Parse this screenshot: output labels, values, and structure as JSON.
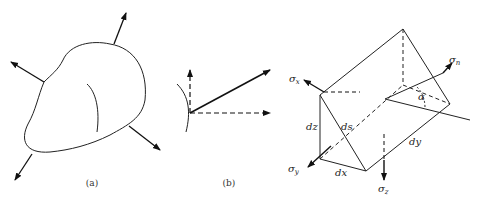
{
  "figure": {
    "panels": [
      {
        "id": "a",
        "caption": "(a)",
        "description": "Arbitrary body with outward force arrows on its surface"
      },
      {
        "id": "b",
        "caption": "(b)",
        "description": "Resultant stress vector at a surface point decomposed into normal and tangential dashed components"
      },
      {
        "id": "c",
        "caption": "",
        "description": "Triangular prism element with stresses on its faces"
      }
    ],
    "labels": {
      "sigma_x": {
        "base": "σ",
        "sub": "x"
      },
      "sigma_n": {
        "base": "σ",
        "sub": "n"
      },
      "sigma_y": {
        "base": "σ",
        "sub": "y"
      },
      "sigma_z": {
        "base": "σ",
        "sub": "z"
      },
      "dz": "dz",
      "ds": "ds",
      "dx": "dx",
      "dy": "dy",
      "alpha": "α"
    }
  }
}
